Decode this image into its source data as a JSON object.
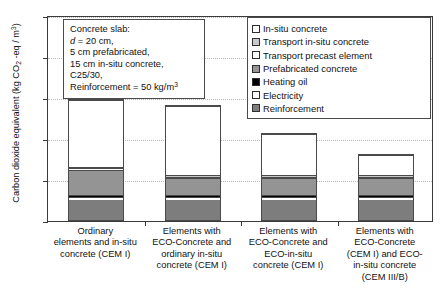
{
  "chart_data": {
    "type": "bar",
    "title": "",
    "subtitle": "",
    "xlabel": "",
    "ylabel": "Carbon dioxide equivalent (kg CO2 -eq / m3)",
    "ylim": [
      0,
      500
    ],
    "yticks": [
      0,
      100,
      200,
      300,
      400,
      500
    ],
    "grid": true,
    "stacked": true,
    "legend_position": "top-right",
    "categories": [
      "Ordinary elements and in-situ concrete (CEM I)",
      "Elements with ECO-Concrete and ordinary in-situ concrete (CEM I)",
      "Elements with ECO-Concrete and ECO-in-situ concrete (CEM I)",
      "Elements with ECO-Concrete (CEM I) and ECO-in-situ concrete (CEM III/B)"
    ],
    "series": [
      {
        "name": "Reinforcement",
        "values": [
          50,
          50,
          50,
          50
        ]
      },
      {
        "name": "Electricity",
        "values": [
          6,
          6,
          6,
          6
        ]
      },
      {
        "name": "Heating oil",
        "values": [
          4,
          4,
          4,
          4
        ]
      },
      {
        "name": "Prefabricated concrete",
        "values": [
          62,
          42,
          42,
          42
        ]
      },
      {
        "name": "Transport precast element",
        "values": [
          4,
          4,
          4,
          4
        ]
      },
      {
        "name": "Transport in-situ concrete",
        "values": [
          4,
          4,
          4,
          4
        ]
      },
      {
        "name": "In-situ concrete",
        "values": [
          164,
          169,
          99,
          49
        ]
      }
    ],
    "totals": [
      294,
      275,
      205,
      155
    ]
  },
  "axis": {
    "y_title_main": "Carbon dioxide equivalent (kg CO",
    "y_title_sub": "2",
    "y_title_mid": " -eq / m",
    "y_title_sup": "3",
    "y_title_end": ")",
    "ticks": [
      "500",
      "400",
      "300",
      "200",
      "100",
      "0"
    ]
  },
  "textbox": {
    "line1": "Concrete slab:",
    "line2_italic": "d",
    "line2_rest": " = 20 cm,",
    "line3": "5 cm prefabricated,",
    "line4": "15 cm in-situ concrete,",
    "line5": "C25/30,",
    "line6_main": "Reinforcement = 50 kg/m",
    "line6_sup": "3"
  },
  "legend": {
    "items": [
      {
        "label": "In-situ concrete",
        "swatch": "insitu",
        "color": "#ffffff"
      },
      {
        "label": "Transport in-situ concrete",
        "swatch": "transit",
        "color": "#c9c9c9"
      },
      {
        "label": "Transport precast element",
        "swatch": "transpre",
        "color": "#ffffff"
      },
      {
        "label": "Prefabricated concrete",
        "swatch": "prefab",
        "color": "#949494"
      },
      {
        "label": "Heating oil",
        "swatch": "heat",
        "color": "#000000"
      },
      {
        "label": "Electricity",
        "swatch": "elec",
        "color": "#ffffff"
      },
      {
        "label": "Reinforcement",
        "swatch": "reinf",
        "color": "#7d7d7d"
      }
    ]
  },
  "categories_display": [
    [
      "Ordinary",
      "elements and in-situ",
      "concrete (CEM I)"
    ],
    [
      "Elements with",
      "ECO-Concrete and",
      "ordinary in-situ",
      "concrete (CEM I)"
    ],
    [
      "Elements with",
      "ECO-Concrete and",
      "ECO-in-situ",
      "concrete (CEM I)"
    ],
    [
      "Elements with",
      "ECO-Concrete",
      "(CEM I) and ECO-",
      "in-situ concrete",
      "(CEM III/B)"
    ]
  ],
  "caption": ""
}
